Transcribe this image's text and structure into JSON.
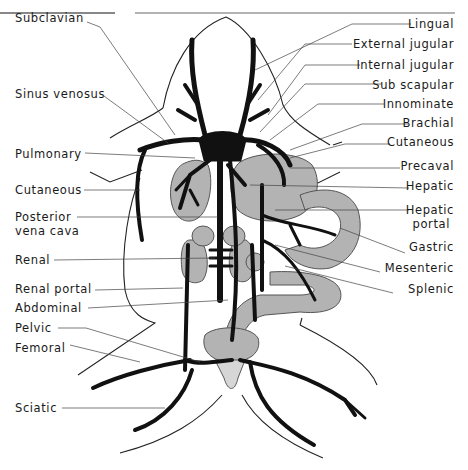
{
  "diagram": {
    "colors": {
      "vein": "#111111",
      "organ": "#b3b3b3",
      "organ_stroke": "#555555",
      "outline": "#222222",
      "leader": "#444444",
      "background": "#ffffff"
    },
    "left_labels": [
      {
        "text": "Subclavian",
        "x": 15,
        "y": 12
      },
      {
        "text": "Sinus venosus",
        "x": 15,
        "y": 88
      },
      {
        "text": "Pulmonary",
        "x": 15,
        "y": 148
      },
      {
        "text": "Cutaneous",
        "x": 15,
        "y": 184
      },
      {
        "text": "Posterior",
        "x": 15,
        "y": 212
      },
      {
        "text": "vena cava",
        "x": 15,
        "y": 226
      },
      {
        "text": "Renal",
        "x": 15,
        "y": 254
      },
      {
        "text": "Renal portal",
        "x": 15,
        "y": 284
      },
      {
        "text": "Abdominal",
        "x": 15,
        "y": 302
      },
      {
        "text": "Pelvic",
        "x": 15,
        "y": 322
      },
      {
        "text": "Femoral",
        "x": 15,
        "y": 342
      },
      {
        "text": "Sciatic",
        "x": 15,
        "y": 402
      }
    ],
    "right_labels": [
      {
        "text": "Lingual",
        "y": 18
      },
      {
        "text": "External jugular",
        "y": 38
      },
      {
        "text": "Internal jugular",
        "y": 59
      },
      {
        "text": "Sub scapular",
        "y": 79
      },
      {
        "text": "Innominate",
        "y": 98
      },
      {
        "text": "Brachial",
        "y": 117
      },
      {
        "text": "Cutaneous",
        "y": 136
      },
      {
        "text": "Precaval",
        "y": 160
      },
      {
        "text": "Hepatic",
        "y": 180
      },
      {
        "text": "Hepatic",
        "y": 204
      },
      {
        "text": "portal",
        "y": 218
      },
      {
        "text": "Gastric",
        "y": 241
      },
      {
        "text": "Mesenteric",
        "y": 262
      },
      {
        "text": "Splenic",
        "y": 283
      }
    ]
  }
}
